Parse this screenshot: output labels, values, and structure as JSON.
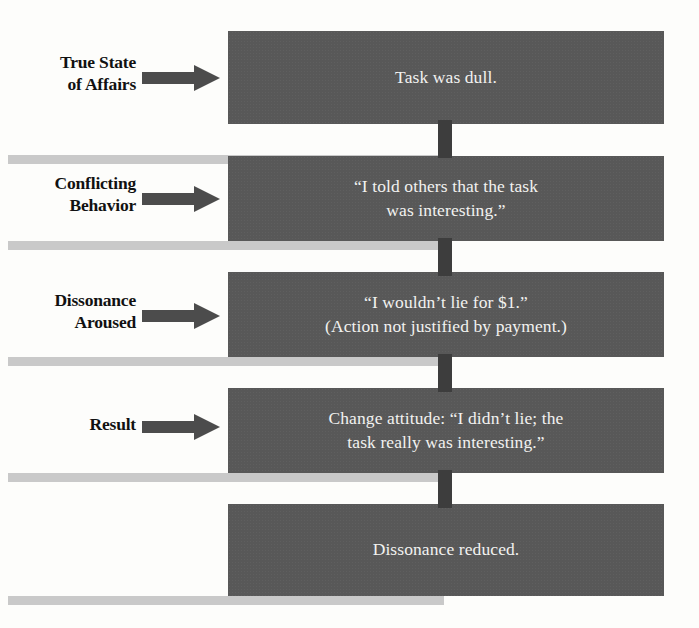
{
  "diagram": {
    "type": "vertical-flow",
    "colors": {
      "background": "#fdfdfb",
      "box_fill": "#585858",
      "box_text": "#f2f2f0",
      "box_shadow": "#c9c9c9",
      "arrow": "#4c4c4c",
      "connector": "#3d3d3d",
      "label_text": "#111111"
    },
    "stages": [
      {
        "label_lines": [
          "True State",
          "of Affairs"
        ],
        "arrow_icon": "right-arrow-icon",
        "box_lines": [
          "Task was dull."
        ]
      },
      {
        "label_lines": [
          "Conflicting",
          "Behavior"
        ],
        "arrow_icon": "right-arrow-icon",
        "box_lines": [
          "“I told others that the task",
          "was interesting.”"
        ]
      },
      {
        "label_lines": [
          "Dissonance",
          "Aroused"
        ],
        "arrow_icon": "right-arrow-icon",
        "box_lines": [
          "“I wouldn’t lie for $1.”",
          "(Action not justified by payment.)"
        ]
      },
      {
        "label_lines": [
          "Result"
        ],
        "arrow_icon": "right-arrow-icon",
        "box_lines": [
          "Change attitude: “I didn’t lie; the",
          "task really was interesting.”"
        ]
      },
      {
        "label_lines": [],
        "arrow_icon": null,
        "box_lines": [
          "Dissonance reduced."
        ]
      }
    ]
  }
}
